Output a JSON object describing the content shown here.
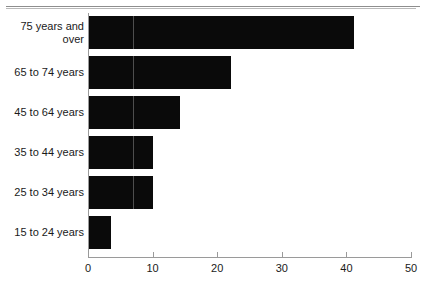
{
  "chart_data": {
    "type": "bar",
    "orientation": "horizontal",
    "title": "",
    "xlabel": "",
    "ylabel": "",
    "categories": [
      "75 years and over",
      "65 to 74 years",
      "45 to 64 years",
      "35 to 44 years",
      "25 to 34 years",
      "15 to 24 years"
    ],
    "values": [
      41.2,
      22.2,
      14.3,
      10.1,
      10.0,
      3.6
    ],
    "xlim": [
      0,
      50
    ],
    "xticks": [
      0,
      10,
      20,
      30,
      40,
      50
    ],
    "xtick_labels": [
      "0",
      "10",
      "20",
      "30",
      "40",
      "50"
    ],
    "grid": false,
    "legend": null,
    "bar_color": "#0a0a0a",
    "axis_color": "#9a9a9a"
  },
  "axis": {
    "ticks": [
      {
        "label": "0",
        "value": 0
      },
      {
        "label": "10",
        "value": 10
      },
      {
        "label": "20",
        "value": 20
      },
      {
        "label": "30",
        "value": 30
      },
      {
        "label": "40",
        "value": 40
      },
      {
        "label": "50",
        "value": 50
      }
    ]
  },
  "bars": [
    {
      "label": "75 years and over",
      "value": 41.2
    },
    {
      "label": "65 to 74 years",
      "value": 22.2
    },
    {
      "label": "45 to 64 years",
      "value": 14.3
    },
    {
      "label": "35 to 44 years",
      "value": 10.1
    },
    {
      "label": "25 to 34 years",
      "value": 10.0
    },
    {
      "label": "15 to 24 years",
      "value": 3.6
    }
  ]
}
